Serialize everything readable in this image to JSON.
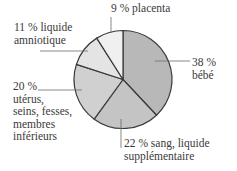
{
  "chart_data": {
    "type": "pie",
    "title": "",
    "start_angle": "12 o'clock",
    "direction": "clockwise",
    "slices": [
      {
        "label": "bébé",
        "percent_text": "38 %",
        "value": 38,
        "color": "#b8b8b8"
      },
      {
        "label": "sang, liquide supplémentaire",
        "percent_text": "22 %",
        "value": 22,
        "color": "#c4c4c4"
      },
      {
        "label": "utérus, seins, fesses, membres inférieurs",
        "percent_text": "20 %",
        "value": 20,
        "color": "#d0d0d0"
      },
      {
        "label": "liquide amniotique",
        "percent_text": "11 %",
        "value": 11,
        "color": "#e4e4e4"
      },
      {
        "label": "placenta",
        "percent_text": "9 %",
        "value": 9,
        "color": "#f0f0f0"
      }
    ],
    "outline_color": "#3a3a3a",
    "labels_display": {
      "bebe": [
        "38 %",
        "bébé"
      ],
      "sang": [
        "22 % sang, liquide",
        "supplémentaire"
      ],
      "uterus": [
        "20 %",
        "utérus,",
        "seins, fesses,",
        "membres",
        "inférieurs"
      ],
      "amnio": [
        "11 % liquide",
        "amniotique"
      ],
      "placenta": [
        "9 % placenta"
      ]
    }
  }
}
